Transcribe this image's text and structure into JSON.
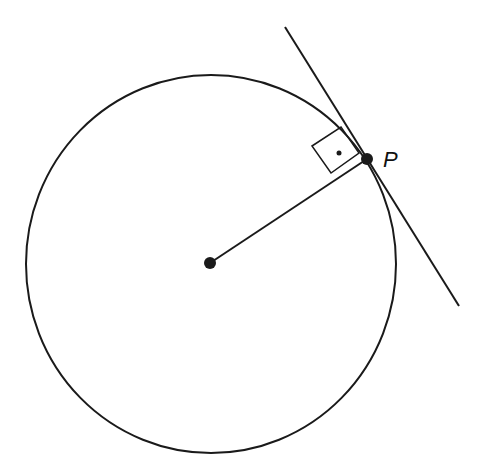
{
  "diagram": {
    "type": "geometry",
    "colors": {
      "stroke": "#1a1a1a",
      "background": "#ffffff"
    },
    "circle": {
      "cx": 211,
      "cy": 264,
      "rx": 185,
      "ry": 189
    },
    "center_point": {
      "x": 210,
      "y": 263
    },
    "point_p": {
      "label": "P",
      "x": 367,
      "y": 159
    },
    "tangent_line": {
      "x1": 285,
      "y1": 27,
      "x2": 459,
      "y2": 306
    },
    "right_angle_marker": {
      "points": "312,146 341,127 359,153 331,173",
      "dot": {
        "x": 339,
        "y": 153
      }
    }
  }
}
